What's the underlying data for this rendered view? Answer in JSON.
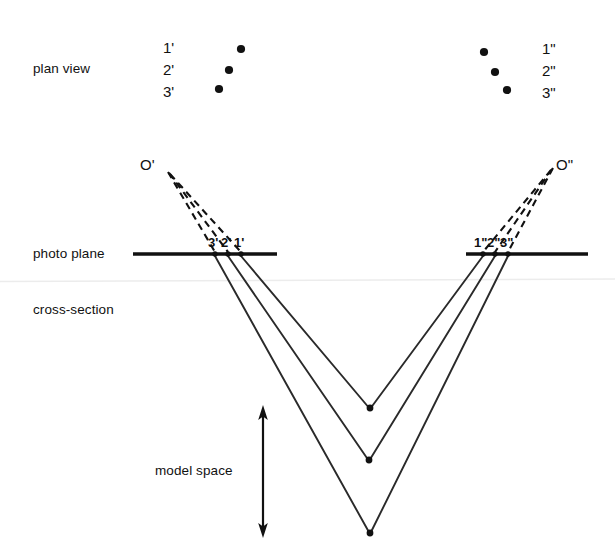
{
  "figure": {
    "background_color": "#ffffff",
    "ink_color": "#111111",
    "artifact_color": "#f0f0f0"
  },
  "row_labels": {
    "plan_view": "plan view",
    "photo_plane": "photo plane",
    "cross_section": "cross-section",
    "model_space": "model space"
  },
  "plan_view": {
    "left": {
      "labels": [
        "1'",
        "2'",
        "3'"
      ],
      "points": [
        {
          "name": "1'",
          "x": 241,
          "y": 49
        },
        {
          "name": "2'",
          "x": 229,
          "y": 70
        },
        {
          "name": "3'",
          "x": 219,
          "y": 89
        }
      ]
    },
    "right": {
      "labels": [
        "1\"",
        "2\"",
        "3\""
      ],
      "points": [
        {
          "name": "1\"",
          "x": 484,
          "y": 52
        },
        {
          "name": "2\"",
          "x": 495,
          "y": 72
        },
        {
          "name": "3\"",
          "x": 507,
          "y": 90
        }
      ]
    }
  },
  "photo_plane": {
    "y": 254,
    "left_line": {
      "x1": 133,
      "x2": 277
    },
    "right_line": {
      "x1": 466,
      "x2": 588
    },
    "left_points": [
      {
        "name": "3'",
        "x": 215
      },
      {
        "name": "2'",
        "x": 228
      },
      {
        "name": "1'",
        "x": 241
      }
    ],
    "right_points": [
      {
        "name": "1\"",
        "x": 483
      },
      {
        "name": "2\"",
        "x": 495
      },
      {
        "name": "3\"",
        "x": 508
      }
    ],
    "left_point_labels": [
      "3'",
      "2'",
      "1'"
    ],
    "right_point_labels": [
      "1\"",
      "2\"",
      "3\""
    ]
  },
  "perspective_centers": {
    "left": {
      "label": "O'",
      "x": 168,
      "y": 172
    },
    "right": {
      "label": "O\"",
      "x": 552,
      "y": 168
    }
  },
  "model_points": [
    {
      "name": "1",
      "x": 370,
      "y": 409
    },
    {
      "name": "2",
      "x": 369,
      "y": 461
    },
    {
      "name": "3",
      "x": 370,
      "y": 534
    }
  ],
  "model_space_arrow": {
    "x": 263,
    "y_top": 408,
    "y_bottom": 535,
    "double_headed": true
  },
  "scan_artifact_line": {
    "y": 281,
    "x1": 0,
    "x2": 615
  }
}
